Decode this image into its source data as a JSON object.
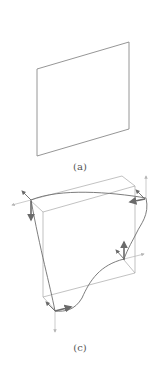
{
  "figures": [
    {
      "id": "a",
      "label": "(a)",
      "description": "undeformed square plate in perspective",
      "stroke_color": "#8a8a8a"
    },
    {
      "id": "c",
      "label": "(c)",
      "description": "plate shown with deformed wavy edges and force/moment arrows at the four corners",
      "box_color": "#a0a0a0",
      "curve_color": "#6e6e6e",
      "arrow_color": "#6a6a6a",
      "axis_color": "#b5b5b5"
    }
  ]
}
